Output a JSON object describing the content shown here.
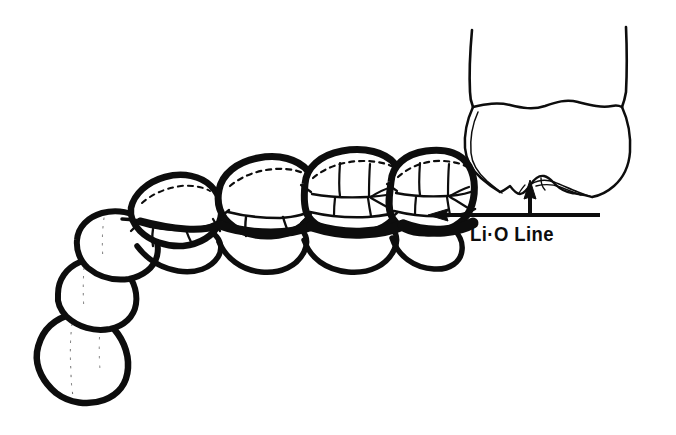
{
  "figure": {
    "background_color": "#ffffff",
    "ink_color": "#0d0d0d",
    "annotation": {
      "label": "Li·O Line",
      "label_plain": "Li-O Line",
      "leader_lines": [
        {
          "name": "horizontal-leader-to-arch",
          "from": [
            600,
            215
          ],
          "to": [
            432,
            215
          ],
          "arrowhead": "left"
        },
        {
          "name": "vertical-leader-to-molar",
          "from": [
            530,
            215
          ],
          "to": [
            530,
            182
          ],
          "arrowhead": "up"
        }
      ]
    },
    "arch": {
      "view": "occlusal",
      "jaw": "mandibular",
      "teeth": [
        {
          "name": "central-incisor",
          "position": 1
        },
        {
          "name": "lateral-incisor",
          "position": 2
        },
        {
          "name": "canine",
          "position": 3
        },
        {
          "name": "first-premolar",
          "position": 4
        },
        {
          "name": "second-premolar",
          "position": 5
        },
        {
          "name": "first-molar",
          "position": 6
        },
        {
          "name": "second-molar",
          "position": 7
        }
      ],
      "lio_line_description": "thick black band along lingual-occlusal margin of posterior teeth"
    },
    "inset": {
      "name": "molar-proximal-section",
      "view": "proximal",
      "description": "mandibular molar outline with two roots, cervical line and lingual cusp detail"
    }
  }
}
